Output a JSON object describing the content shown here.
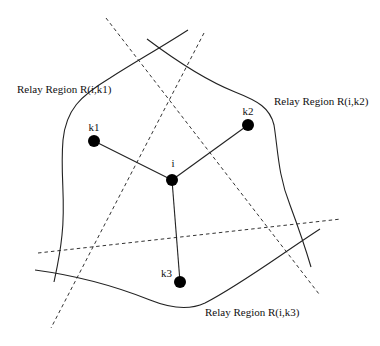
{
  "diagram": {
    "width": 380,
    "height": 346,
    "nodes": [
      {
        "id": "i",
        "label": "i",
        "cx": 172,
        "cy": 180,
        "r": 6,
        "lx": 173,
        "ly": 167,
        "anchor": "middle"
      },
      {
        "id": "k1",
        "label": "k1",
        "cx": 94,
        "cy": 141,
        "r": 6,
        "lx": 94,
        "ly": 131,
        "anchor": "middle"
      },
      {
        "id": "k2",
        "label": "k2",
        "cx": 248,
        "cy": 125,
        "r": 6,
        "lx": 248,
        "ly": 115,
        "anchor": "middle"
      },
      {
        "id": "k3",
        "label": "k3",
        "cx": 180,
        "cy": 282,
        "r": 6,
        "lx": 172,
        "ly": 277,
        "anchor": "end"
      }
    ],
    "edges": [
      {
        "from": "i",
        "to": "k1",
        "x1": 172,
        "y1": 180,
        "x2": 94,
        "y2": 141
      },
      {
        "from": "i",
        "to": "k2",
        "x1": 172,
        "y1": 180,
        "x2": 248,
        "y2": 125
      },
      {
        "from": "i",
        "to": "k3",
        "x1": 172,
        "y1": 180,
        "x2": 180,
        "y2": 282
      }
    ],
    "regions": [
      {
        "name": "relay-region-boundary-k1",
        "d": "M188,30 C160,48 135,62 110,78 C80,96 66,110 63,140 C60,175 66,200 62,235 C60,255 57,268 54,282"
      },
      {
        "name": "relay-region-boundary-k2",
        "d": "M147,39 C175,60 205,80 235,92 C258,101 270,108 274,125 C278,150 278,175 290,205 C300,232 306,250 311,267"
      },
      {
        "name": "relay-region-boundary-k3",
        "d": "M35,270 C80,276 120,288 150,300 C170,308 190,310 205,303 C240,285 280,255 320,229"
      }
    ],
    "bisectors": [
      {
        "name": "bisector-i-k1-k2",
        "x1": 106,
        "y1": 18,
        "x2": 319,
        "y2": 294
      },
      {
        "name": "bisector-k1-k3",
        "x1": 204,
        "y1": 33,
        "x2": 51,
        "y2": 328
      },
      {
        "name": "bisector-k2-k3",
        "x1": 38,
        "y1": 253,
        "x2": 341,
        "y2": 219
      }
    ],
    "labels": [
      {
        "name": "label-relay-region-k1",
        "text": "Relay Region R(i,k1)",
        "x": 17,
        "y": 93
      },
      {
        "name": "label-relay-region-k2",
        "text": "Relay Region R(i,k2)",
        "x": 274,
        "y": 105
      },
      {
        "name": "label-relay-region-k3",
        "text": "Relay Region R(i,k3)",
        "x": 205,
        "y": 316
      }
    ],
    "colors": {
      "background": "#ffffff",
      "stroke": "#222222",
      "node_fill": "#000000"
    }
  }
}
